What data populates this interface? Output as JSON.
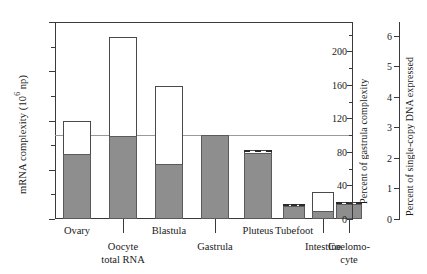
{
  "chart_data": {
    "type": "bar",
    "title": "",
    "categories": [
      "Ovary",
      "Oocyte total RNA",
      "Blastula",
      "Gastrula",
      "Pluteus",
      "Tubefoot",
      "Intestine",
      "Coelomocyte"
    ],
    "category_label_lines": [
      [
        "Ovary"
      ],
      [
        "Oocyte",
        "total RNA"
      ],
      [
        "Blastula"
      ],
      [
        "Gastrula"
      ],
      [
        "Pluteus"
      ],
      [
        "Tubefoot"
      ],
      [
        "Intestine"
      ],
      [
        "Coelomo-",
        "cyte"
      ]
    ],
    "series": [
      {
        "name": "Total mRNA complexity",
        "style": "open-outline",
        "values": [
          20.0,
          37.0,
          27.0,
          17.0,
          14.0,
          3.0,
          5.5,
          3.5
        ]
      },
      {
        "name": "Shared with gastrula (solid fill)",
        "style": "gray-fill",
        "values": [
          13.2,
          16.8,
          11.2,
          17.0,
          13.4,
          2.6,
          1.7,
          3.0
        ]
      }
    ],
    "dashed_top_markers": [
      null,
      null,
      null,
      null,
      14.0,
      3.0,
      null,
      3.5
    ],
    "reference_line": 17.0,
    "xlabel": "",
    "ylabel": "mRNA complexity (10⁶ np)",
    "ylim": [
      0,
      40
    ],
    "yticks": [
      0,
      10,
      20,
      30,
      40
    ],
    "yticks_minor": [
      5,
      15,
      25,
      35
    ],
    "y2label": "Percent of gastrula complexity",
    "y2lim": [
      0,
      235
    ],
    "y2ticks": [
      0,
      40,
      80,
      120,
      160,
      200
    ],
    "y2ticks_minor": [
      20,
      60,
      100,
      140,
      180,
      220
    ],
    "y3label": "Percent of single-copy DNA expressed",
    "y3lim": [
      0,
      6.45
    ],
    "y3ticks": [
      0,
      1,
      2,
      3,
      4,
      5,
      6
    ],
    "grid": false,
    "legend": "none"
  },
  "axes": {
    "left": {
      "title_main": "mRNA complexity (10",
      "title_sup": "6",
      "title_tail": " np)",
      "ticks": [
        "0",
        "10",
        "20",
        "30",
        "40"
      ]
    },
    "middle": {
      "title": "Percent of gastrula complexity",
      "ticks": [
        "0",
        "40",
        "80",
        "120",
        "160",
        "200"
      ]
    },
    "right": {
      "title": "Percent of single-copy DNA expressed",
      "ticks": [
        "0",
        "1",
        "2",
        "3",
        "4",
        "5",
        "6"
      ]
    }
  }
}
